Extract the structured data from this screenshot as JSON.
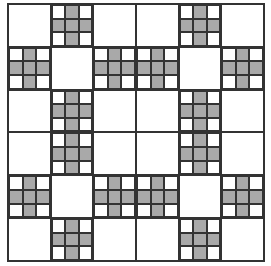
{
  "board": {
    "rows": 6,
    "cols": 6,
    "fill_color": "#a9a9a9",
    "line_color": "#333333",
    "cross_pattern": [
      0,
      1,
      0,
      1,
      1,
      1,
      0,
      1,
      0
    ],
    "cross_cells": [
      [
        0,
        1,
        0,
        0,
        1,
        0
      ],
      [
        1,
        0,
        1,
        1,
        0,
        1
      ],
      [
        0,
        1,
        0,
        0,
        1,
        0
      ],
      [
        0,
        1,
        0,
        0,
        1,
        0
      ],
      [
        1,
        0,
        1,
        1,
        0,
        1
      ],
      [
        0,
        1,
        0,
        0,
        1,
        0
      ]
    ]
  }
}
